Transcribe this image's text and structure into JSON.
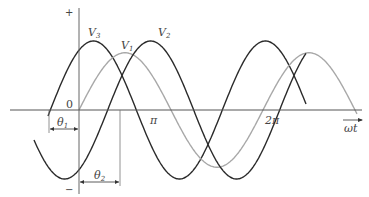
{
  "diagram": {
    "axis": {
      "plus_label": "+",
      "minus_label": "−",
      "origin_label": "0",
      "x_axis_label": "ωt",
      "ticks": [
        {
          "label": "π",
          "value_rad": 3.14159
        },
        {
          "label": "2π",
          "value_rad": 6.28318
        }
      ]
    },
    "waves": [
      {
        "name": "V",
        "subscript": "3",
        "phase_deg": 60,
        "color": "#2a2a2a",
        "amplitude": 1.0
      },
      {
        "name": "V",
        "subscript": "1",
        "phase_deg": 0,
        "color": "#a8a8a8",
        "amplitude": 0.83
      },
      {
        "name": "V",
        "subscript": "2",
        "phase_deg": -60,
        "color": "#2a2a2a",
        "amplitude": 1.0
      }
    ],
    "angles": [
      {
        "label": "θ",
        "subscript": "1",
        "description": "lead of V3 relative to origin"
      },
      {
        "label": "θ",
        "subscript": "2",
        "description": "lag of V2 relative to origin"
      }
    ]
  }
}
